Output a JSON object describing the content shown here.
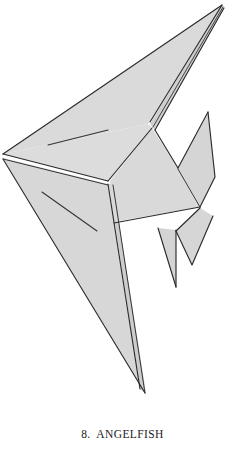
{
  "plate": {
    "kind": "origami-diagram",
    "model_name": "ANGELFISH",
    "step_number": "8.",
    "caption_number": "8.",
    "caption_label": "ANGELFISH",
    "caption_full": "8.  ANGELFISH",
    "background_color": "#ffffff"
  },
  "figure": {
    "name": "angelfish-origami",
    "paper_fill": "#d9d9d9",
    "paper_fill_shaded": "#d2d2d2",
    "paper_fill_light": "#e0e0e0",
    "outline_color": "#2b2b2b",
    "crease_color": "#333333",
    "white_gap": "#ffffff",
    "panels": [
      {
        "name": "upper-dorsal-spike",
        "fill": "#dadada",
        "points": "3,154 222,5 150,121 148,124"
      },
      {
        "name": "dorsal-spike-underside",
        "fill": "#cfcfcf",
        "points": "222,5 150,124 155,129 224,8"
      },
      {
        "name": "left-body-upper",
        "fill": "#dcdcdc",
        "points": "3,154 148,124 110,179 108,181"
      },
      {
        "name": "left-body-lower-tail",
        "fill": "#d7d7d7",
        "points": "3,158 108,184 139,387 145,393"
      },
      {
        "name": "tail-fin-inner",
        "fill": "#cdcdcd",
        "points": "108,184 113,184 146,392 140,389"
      },
      {
        "name": "mid-body-panel",
        "fill": "#d9d9d9",
        "points": "152,128 178,168 200,207 113,222 111,184"
      },
      {
        "name": "pectoral-fin-right",
        "fill": "#d5d5d5",
        "points": "208,113 178,168 200,206 216,176"
      },
      {
        "name": "ventral-fin-small",
        "fill": "#d4d4d4",
        "points": "158,228 176,230 175,287"
      },
      {
        "name": "lower-right-flank",
        "fill": "#d6d6d6",
        "points": "176,230 200,208 213,215 192,265"
      }
    ],
    "creases": [
      {
        "name": "crease-upper-left",
        "path": "M48,145 L108,130"
      },
      {
        "name": "crease-lower-left",
        "path": "M42,192 L97,231"
      },
      {
        "name": "fold-left-vertex-to-junction",
        "path": "M3,154 L108,181"
      },
      {
        "name": "fold-left-vertex-to-junction-2",
        "path": "M3,159 L108,185"
      },
      {
        "name": "fold-spike-ridge",
        "path": "M222,5 L150,122"
      },
      {
        "name": "fold-spike-ridge-2",
        "path": "M223,8 L154,128"
      },
      {
        "name": "fold-body-spine",
        "path": "M108,183 L140,388"
      },
      {
        "name": "fold-body-spine-2",
        "path": "M112,183 L145,392"
      },
      {
        "name": "fold-notch-v-left",
        "path": "M152,128 L178,168"
      },
      {
        "name": "fold-notch-v-right",
        "path": "M178,168 L208,113"
      },
      {
        "name": "fold-fin-to-body",
        "path": "M178,169 L200,207"
      },
      {
        "name": "fold-mid-body-base",
        "path": "M113,222 L200,207"
      },
      {
        "name": "fold-ventral-left",
        "path": "M158,228 L175,287"
      },
      {
        "name": "fold-ventral-right",
        "path": "M176,230 L176,286"
      },
      {
        "name": "fold-right-flank",
        "path": "M200,208 L192,264"
      }
    ]
  }
}
